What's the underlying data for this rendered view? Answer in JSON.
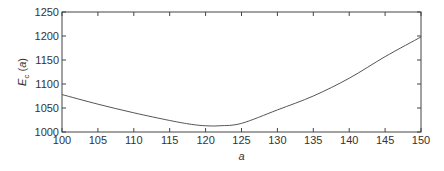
{
  "chart_data": {
    "type": "line",
    "title": "",
    "xlabel": "a",
    "ylabel": "E_c (a)",
    "ylabel_parts": {
      "main": "E",
      "sub": "c",
      "arg": "(a)"
    },
    "xlim": [
      100,
      150
    ],
    "ylim": [
      1000,
      1250
    ],
    "xticks": [
      100,
      105,
      110,
      115,
      120,
      125,
      130,
      135,
      140,
      145,
      150
    ],
    "yticks": [
      1000,
      1050,
      1100,
      1150,
      1200,
      1250
    ],
    "grid": false,
    "legend": null,
    "series": [
      {
        "name": "E_c(a)",
        "color": "#555555",
        "x": [
          100,
          105,
          110,
          115,
          118,
          120,
          122,
          125,
          130,
          135,
          140,
          145,
          150
        ],
        "values": [
          1078,
          1058,
          1040,
          1024,
          1016,
          1013,
          1013,
          1018,
          1046,
          1075,
          1112,
          1157,
          1198
        ]
      }
    ]
  }
}
